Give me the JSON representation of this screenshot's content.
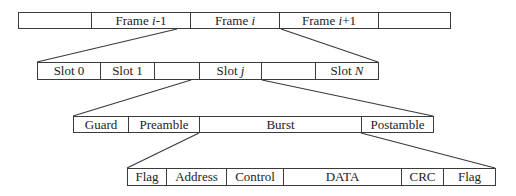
{
  "diagram": {
    "rows": [
      {
        "name": "frames",
        "top": 12,
        "height": 17,
        "cells": [
          {
            "x": 18,
            "w": 73,
            "label": ""
          },
          {
            "x": 91,
            "w": 99,
            "label": "Frame ",
            "var": "i",
            "suffix": "-1"
          },
          {
            "x": 190,
            "w": 89,
            "label": "Frame ",
            "var": "i",
            "suffix": ""
          },
          {
            "x": 279,
            "w": 99,
            "label": "Frame ",
            "var": "i",
            "suffix": "+1"
          },
          {
            "x": 378,
            "w": 72,
            "label": ""
          }
        ]
      },
      {
        "name": "slots",
        "top": 62,
        "height": 18,
        "cells": [
          {
            "x": 37,
            "w": 63,
            "label": "Slot 0",
            "var": "",
            "suffix": ""
          },
          {
            "x": 100,
            "w": 54,
            "label": "Slot 1",
            "var": "",
            "suffix": ""
          },
          {
            "x": 154,
            "w": 45,
            "label": ""
          },
          {
            "x": 199,
            "w": 62,
            "label": "Slot ",
            "var": "j",
            "suffix": ""
          },
          {
            "x": 261,
            "w": 54,
            "label": ""
          },
          {
            "x": 315,
            "w": 63,
            "label": "Slot ",
            "var": "N",
            "suffix": ""
          }
        ]
      },
      {
        "name": "slot-structure",
        "top": 116,
        "height": 17,
        "cells": [
          {
            "x": 73,
            "w": 55,
            "label": "Guard",
            "var": "",
            "suffix": ""
          },
          {
            "x": 128,
            "w": 71,
            "label": "Preamble",
            "var": "",
            "suffix": ""
          },
          {
            "x": 199,
            "w": 162,
            "label": "Burst",
            "var": "",
            "suffix": ""
          },
          {
            "x": 361,
            "w": 72,
            "label": "Postamble",
            "var": "",
            "suffix": ""
          }
        ]
      },
      {
        "name": "burst-structure",
        "top": 168,
        "height": 18,
        "cells": [
          {
            "x": 127,
            "w": 39,
            "label": "Flag",
            "var": "",
            "suffix": ""
          },
          {
            "x": 166,
            "w": 60,
            "label": "Address",
            "var": "",
            "suffix": ""
          },
          {
            "x": 226,
            "w": 57,
            "label": "Control",
            "var": "",
            "suffix": ""
          },
          {
            "x": 283,
            "w": 118,
            "label": "DATA",
            "var": "",
            "suffix": ""
          },
          {
            "x": 401,
            "w": 42,
            "label": "CRC",
            "var": "",
            "suffix": ""
          },
          {
            "x": 443,
            "w": 52,
            "label": "Flag",
            "var": "",
            "suffix": ""
          }
        ]
      }
    ],
    "connectors": [
      {
        "from": [
          177,
          29
        ],
        "to": [
          37,
          62
        ]
      },
      {
        "from": [
          281,
          29
        ],
        "to": [
          378,
          62
        ]
      },
      {
        "from": [
          191,
          80
        ],
        "to": [
          73,
          116
        ]
      },
      {
        "from": [
          262,
          80
        ],
        "to": [
          433,
          116
        ]
      },
      {
        "from": [
          199,
          133
        ],
        "to": [
          127,
          168
        ]
      },
      {
        "from": [
          361,
          133
        ],
        "to": [
          495,
          168
        ]
      }
    ],
    "line_color": "#3a3a3a"
  }
}
